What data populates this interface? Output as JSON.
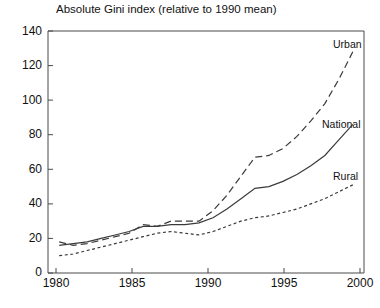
{
  "chart_data": {
    "type": "line",
    "title": "Absolute Gini index (relative to 1990 mean)",
    "xlabel": "",
    "ylabel": "",
    "xlim": [
      1979.2,
      2001.8
    ],
    "ylim": [
      0,
      140
    ],
    "xticks": [
      "1980",
      "1985",
      "1990",
      "1995",
      "2000"
    ],
    "xtick_values": [
      1980,
      1985,
      1990,
      1995,
      2000
    ],
    "yticks": [
      "0",
      "20",
      "40",
      "60",
      "80",
      "100",
      "120",
      "140"
    ],
    "ytick_values": [
      0,
      20,
      40,
      60,
      80,
      100,
      120,
      140
    ],
    "grid": false,
    "legend_position": "inline-right-of-line-ends",
    "x": [
      1980,
      1981,
      1982,
      1983,
      1984,
      1985,
      1986,
      1987,
      1988,
      1989,
      1990,
      1991,
      1992,
      1993,
      1994,
      1995,
      1996,
      1997,
      1998,
      1999,
      2000,
      2001
    ],
    "series": [
      {
        "name": "Urban",
        "style": "long-dash",
        "color": "#3a3a3a",
        "values": [
          18,
          16,
          17,
          19,
          21,
          23,
          28,
          27,
          30,
          30,
          30,
          36,
          45,
          56,
          67,
          68,
          72,
          79,
          88,
          98,
          112,
          128
        ]
      },
      {
        "name": "National",
        "style": "solid",
        "color": "#3a3a3a",
        "values": [
          16,
          17,
          18,
          20,
          22,
          24,
          27,
          27,
          28,
          28,
          29,
          32,
          37,
          43,
          49,
          50,
          53,
          57,
          62,
          68,
          77,
          86
        ]
      },
      {
        "name": "Rural",
        "style": "short-dash",
        "color": "#3a3a3a",
        "values": [
          10,
          11,
          13,
          15,
          17,
          19,
          21,
          23,
          24,
          23,
          22,
          24,
          27,
          30,
          32,
          33,
          35,
          37,
          40,
          43,
          47,
          51
        ]
      }
    ],
    "annotations": [
      {
        "text": "Urban",
        "x": 2001.0,
        "y": 131
      },
      {
        "text": "National",
        "x": 2000.2,
        "y": 95
      },
      {
        "text": "Rural",
        "x": 2000.2,
        "y": 58
      }
    ]
  },
  "footer": {
    "cut_text": ""
  }
}
